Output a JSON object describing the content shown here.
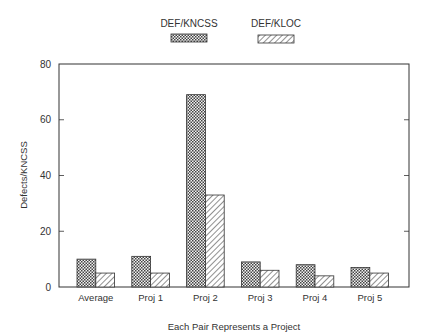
{
  "chart_data": {
    "type": "bar",
    "title": "",
    "xlabel": "Each Pair Represents a Project",
    "ylabel": "Defects/KNCSS",
    "ylim": [
      0,
      80
    ],
    "yticks": [
      0,
      20,
      40,
      60,
      80
    ],
    "grid": false,
    "legend_position": "top-center",
    "categories": [
      "Average",
      "Proj 1",
      "Proj 2",
      "Proj 3",
      "Proj 4",
      "Proj 5"
    ],
    "series": [
      {
        "name": "DEF/KNCSS",
        "pattern": "crosshatch",
        "values": [
          10,
          11,
          69,
          9,
          8,
          7
        ]
      },
      {
        "name": "DEF/KLOC",
        "pattern": "diagonal-hatch",
        "values": [
          5,
          5,
          33,
          6,
          4,
          5
        ]
      }
    ]
  },
  "colors": {
    "axis": "#333333",
    "text": "#333333",
    "fill_dark": "#555555",
    "fill_light": "#ffffff"
  }
}
